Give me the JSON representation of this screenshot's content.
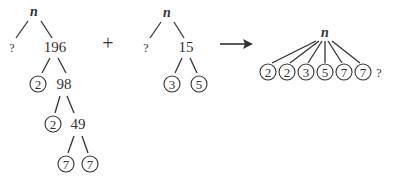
{
  "trees": [
    {
      "root": "n",
      "unknown": "?",
      "composite": "196",
      "levels": [
        {
          "prime": "2",
          "rest": "98"
        },
        {
          "prime": "2",
          "rest": "49"
        },
        {
          "primes": [
            "7",
            "7"
          ]
        }
      ]
    },
    {
      "root": "n",
      "unknown": "?",
      "composite": "15",
      "primes": [
        "3",
        "5"
      ]
    },
    {
      "root": "n",
      "primes": [
        "2",
        "2",
        "3",
        "5",
        "7",
        "7"
      ],
      "unknown": "?"
    }
  ],
  "operators": {
    "plus": "+",
    "arrow": "→"
  }
}
